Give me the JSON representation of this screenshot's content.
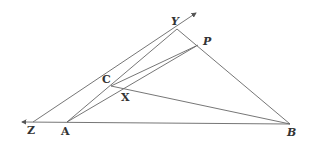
{
  "diagram": {
    "type": "geometry",
    "stroke_color": "#555555",
    "label_color": "#333333",
    "points": [
      {
        "name": "Z",
        "label": "Z",
        "x": 22,
        "y": 122
      },
      {
        "name": "A",
        "label": "A",
        "x": 67,
        "y": 122
      },
      {
        "name": "B",
        "label": "B",
        "x": 290,
        "y": 124
      },
      {
        "name": "C",
        "label": "C",
        "x": 111,
        "y": 86
      },
      {
        "name": "X",
        "label": "X",
        "x": 120,
        "y": 92
      },
      {
        "name": "Y",
        "label": "Y",
        "x": 177,
        "y": 29
      },
      {
        "name": "P",
        "label": "P",
        "x": 198,
        "y": 45
      }
    ],
    "segments": [
      [
        "B",
        "Z"
      ],
      [
        "Z",
        "Y"
      ],
      [
        "A",
        "Y"
      ],
      [
        "A",
        "P"
      ],
      [
        "C",
        "P"
      ],
      [
        "C",
        "B"
      ],
      [
        "Y",
        "B"
      ]
    ],
    "labels": {
      "Z": "Z",
      "A": "A",
      "B": "B",
      "C": "C",
      "X": "X",
      "Y": "Y",
      "P": "P"
    }
  }
}
